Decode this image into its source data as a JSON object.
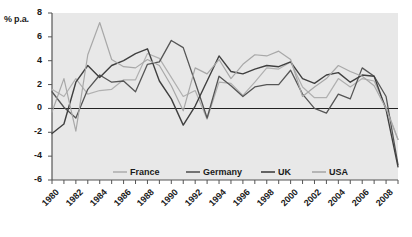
{
  "chart_data": {
    "type": "line",
    "title": "",
    "xlabel": "",
    "ylabel": "% p.a.",
    "ylim": [
      -6,
      8
    ],
    "xlim": [
      1980,
      2009
    ],
    "grid": false,
    "legend_position": "bottom-inside",
    "x": [
      1980,
      1981,
      1982,
      1983,
      1984,
      1985,
      1986,
      1987,
      1988,
      1989,
      1990,
      1991,
      1992,
      1993,
      1994,
      1995,
      1996,
      1997,
      1998,
      1999,
      2000,
      2001,
      2002,
      2003,
      2004,
      2005,
      2006,
      2007,
      2008,
      2009
    ],
    "xticks": [
      1980,
      1982,
      1984,
      1986,
      1988,
      1990,
      1992,
      1994,
      1996,
      1998,
      2000,
      2002,
      2004,
      2006,
      2008
    ],
    "xticklabels": [
      "1980",
      "1982",
      "1984",
      "1986",
      "1988",
      "1990",
      "1992",
      "1994",
      "1996",
      "1998",
      "2000",
      "2002",
      "2004",
      "2006",
      "2008"
    ],
    "yticks": [
      -6,
      -4,
      -2,
      0,
      2,
      4,
      6,
      8
    ],
    "yticklabels": [
      "-6",
      "-4",
      "-2",
      "0",
      "2",
      "4",
      "6",
      "8"
    ],
    "series": [
      {
        "name": "France",
        "color": "#b0b0b0",
        "values": [
          1.6,
          1.0,
          2.5,
          1.2,
          1.5,
          1.6,
          2.4,
          2.4,
          4.6,
          4.2,
          2.6,
          1.0,
          1.5,
          -0.9,
          2.2,
          2.1,
          1.1,
          2.2,
          3.4,
          3.3,
          3.9,
          1.8,
          0.9,
          0.9,
          2.5,
          1.8,
          2.5,
          2.3,
          0.1,
          -2.6
        ]
      },
      {
        "name": "Germany",
        "color": "#555555",
        "values": [
          1.4,
          0.1,
          -0.8,
          1.6,
          2.8,
          2.2,
          2.3,
          1.4,
          3.7,
          3.9,
          5.7,
          5.1,
          2.2,
          -0.8,
          2.7,
          1.9,
          1.0,
          1.8,
          2.0,
          2.0,
          3.2,
          1.2,
          0.0,
          -0.4,
          1.2,
          0.8,
          3.4,
          2.7,
          1.0,
          -4.7
        ]
      },
      {
        "name": "UK",
        "color": "#404040",
        "values": [
          -2.1,
          -1.3,
          2.2,
          3.6,
          2.6,
          3.6,
          4.0,
          4.6,
          5.0,
          2.3,
          0.8,
          -1.4,
          0.2,
          2.3,
          4.4,
          3.1,
          2.9,
          3.3,
          3.6,
          3.5,
          3.9,
          2.5,
          2.1,
          2.8,
          3.0,
          2.2,
          2.8,
          2.7,
          -0.1,
          -4.9
        ]
      },
      {
        "name": "USA",
        "color": "#a8a8a8",
        "values": [
          -0.3,
          2.5,
          -1.9,
          4.5,
          7.2,
          4.1,
          3.5,
          3.4,
          4.1,
          3.6,
          1.9,
          -0.2,
          3.4,
          2.9,
          4.1,
          2.5,
          3.7,
          4.5,
          4.4,
          4.8,
          4.1,
          1.0,
          1.8,
          2.5,
          3.6,
          3.1,
          2.7,
          1.9,
          0.0,
          -2.6
        ]
      }
    ]
  },
  "legend": {
    "items": [
      {
        "label": "France"
      },
      {
        "label": "Germany"
      },
      {
        "label": "UK"
      },
      {
        "label": "USA"
      }
    ]
  },
  "axes": {
    "ylabel": "% p.a."
  }
}
